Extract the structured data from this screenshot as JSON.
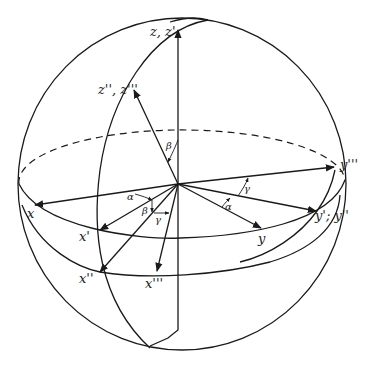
{
  "diagram": {
    "type": "euler-angle-rotation-sphere",
    "colors": {
      "ink": "#1a1a1a",
      "background": "#ffffff"
    },
    "axis_labels": {
      "z_top": "z, z'",
      "z_tilted": "z'', z'''",
      "x": "x",
      "x1": "x'",
      "x2": "x''",
      "x3": "x'''",
      "y": "y",
      "y12": "y'; y''",
      "y3": "y'''"
    },
    "angle_labels": {
      "alpha_left": "α",
      "alpha_right": "α",
      "beta_top": "β",
      "beta_left": "β",
      "gamma_left": "γ",
      "gamma_right": "γ"
    }
  }
}
